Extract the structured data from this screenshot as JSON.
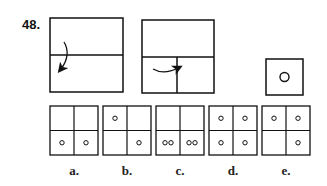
{
  "question": {
    "number_label": "48.",
    "description": "Paper folding: fold top half down, then fold bottom-left quarter to the right, punch a hole; choose how the paper looks when unfolded."
  },
  "steps": [
    {
      "name": "fold-step-1",
      "fold": "top half folded down over bottom half",
      "arrow": "curved-down"
    },
    {
      "name": "fold-step-2",
      "fold": "left quarter folded right",
      "arrow": "curved-right"
    },
    {
      "name": "punch-step",
      "holes": 1
    }
  ],
  "options": [
    {
      "label": "a.",
      "holes": {
        "top_left": 0,
        "top_right": 0,
        "bottom_left": 1,
        "bottom_right": 1
      }
    },
    {
      "label": "b.",
      "holes": {
        "top_left": 1,
        "top_right": 0,
        "bottom_left": 0,
        "bottom_right": 1
      }
    },
    {
      "label": "c.",
      "holes": {
        "top_left": 0,
        "top_right": 0,
        "bottom_left": 2,
        "bottom_right": 2
      }
    },
    {
      "label": "d.",
      "holes": {
        "top_left": 1,
        "top_right": 1,
        "bottom_left": 1,
        "bottom_right": 1
      }
    },
    {
      "label": "e.",
      "holes": {
        "top_left": 1,
        "top_right": 1,
        "bottom_left": 0,
        "bottom_right": 1
      }
    }
  ],
  "colors": {
    "ink": "#111111",
    "background": "#ffffff"
  }
}
